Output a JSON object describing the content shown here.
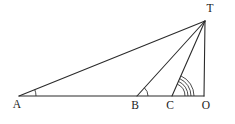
{
  "figure": {
    "type": "geometry-diagram",
    "background_color": "#ffffff",
    "stroke_color": "#2b2b2b",
    "label_color": "#1a1a1a",
    "points": [
      {
        "id": "A",
        "label": "A",
        "x": 19,
        "y": 96,
        "label_x": 17,
        "label_y": 108
      },
      {
        "id": "B",
        "label": "B",
        "x": 137,
        "y": 96,
        "label_x": 135,
        "label_y": 109
      },
      {
        "id": "C",
        "label": "C",
        "x": 172,
        "y": 96,
        "label_x": 170,
        "label_y": 109
      },
      {
        "id": "O",
        "label": "O",
        "x": 204,
        "y": 96,
        "label_x": 206,
        "label_y": 109
      },
      {
        "id": "T",
        "label": "T",
        "x": 205,
        "y": 21,
        "label_x": 210,
        "label_y": 12
      }
    ],
    "segments": [
      {
        "id": "base-AO",
        "from": "A",
        "to": "O"
      },
      {
        "id": "side-TO",
        "from": "T",
        "to": "O"
      },
      {
        "id": "ray-AT",
        "from": "A",
        "to": "T"
      },
      {
        "id": "ray-BT",
        "from": "B",
        "to": "T"
      },
      {
        "id": "ray-CT",
        "from": "C",
        "to": "T"
      }
    ],
    "angle_marks": [
      {
        "id": "angle-A",
        "vertex": "A",
        "arcs": 1,
        "radii": [
          17
        ]
      },
      {
        "id": "angle-B",
        "vertex": "B",
        "arcs": 1,
        "radii": [
          11
        ]
      },
      {
        "id": "angle-C",
        "vertex": "C",
        "arcs": 4,
        "radii": [
          13,
          16,
          19,
          22
        ]
      }
    ]
  }
}
